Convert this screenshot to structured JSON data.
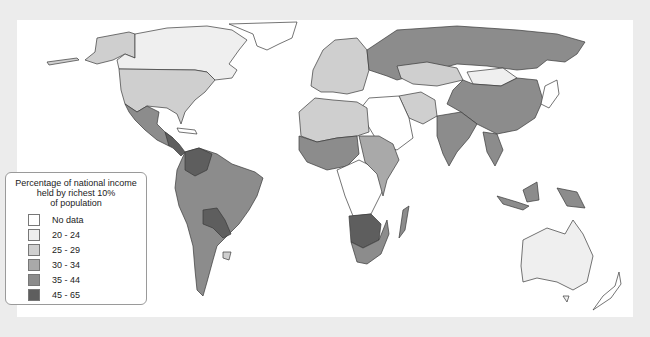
{
  "map": {
    "type": "choropleth",
    "subject": "World map"
  },
  "legend": {
    "title": "Percentage of national income held by richest 10% of population",
    "title_lines": [
      "Percentage of national income",
      "held by richest 10%",
      "of population"
    ],
    "items": [
      {
        "label": "No data",
        "color": "#ffffff"
      },
      {
        "label": "20 - 24",
        "color": "#efefef"
      },
      {
        "label": "25 - 29",
        "color": "#cfcfcf"
      },
      {
        "label": "30 - 34",
        "color": "#a9a9a9"
      },
      {
        "label": "35 - 44",
        "color": "#8c8c8c"
      },
      {
        "label": "45 - 65",
        "color": "#5e5e5e"
      }
    ]
  },
  "regions": [
    {
      "name": "Canada",
      "class": "20 - 24"
    },
    {
      "name": "Alaska",
      "class": "25 - 29"
    },
    {
      "name": "Greenland",
      "class": "No data"
    },
    {
      "name": "United States",
      "class": "25 - 29"
    },
    {
      "name": "Mexico",
      "class": "35 - 44"
    },
    {
      "name": "Central America",
      "class": "45 - 65"
    },
    {
      "name": "South America",
      "class": "35 - 44"
    },
    {
      "name": "Bolivia/Paraguay",
      "class": "45 - 65"
    },
    {
      "name": "Europe",
      "class": "25 - 29"
    },
    {
      "name": "Russia",
      "class": "35 - 44"
    },
    {
      "name": "Kazakhstan",
      "class": "25 - 29"
    },
    {
      "name": "Mongolia",
      "class": "20 - 24"
    },
    {
      "name": "China",
      "class": "35 - 44"
    },
    {
      "name": "India",
      "class": "35 - 44"
    },
    {
      "name": "Middle East",
      "class": "No data"
    },
    {
      "name": "Iran",
      "class": "25 - 29"
    },
    {
      "name": "North Africa",
      "class": "25 - 29"
    },
    {
      "name": "West Africa",
      "class": "35 - 44"
    },
    {
      "name": "Central Africa",
      "class": "No data"
    },
    {
      "name": "East Africa",
      "class": "30 - 34"
    },
    {
      "name": "Southern Africa",
      "class": "45 - 65"
    },
    {
      "name": "South Africa",
      "class": "35 - 44"
    },
    {
      "name": "Madagascar",
      "class": "35 - 44"
    },
    {
      "name": "Southeast Asia",
      "class": "35 - 44"
    },
    {
      "name": "Japan",
      "class": "No data"
    },
    {
      "name": "Australia",
      "class": "20 - 24"
    },
    {
      "name": "New Zealand",
      "class": "No data"
    }
  ]
}
